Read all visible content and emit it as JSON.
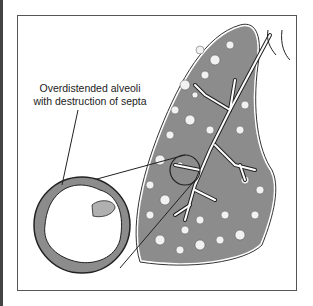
{
  "figure": {
    "label_line1": "Overdistended alveoli",
    "label_line2": "with destruction of septa",
    "corner_annotation": "bd",
    "colors": {
      "tissue": "#8c8c8c",
      "outline": "#222222",
      "background": "#ffffff",
      "airway": "#ffffff"
    }
  }
}
